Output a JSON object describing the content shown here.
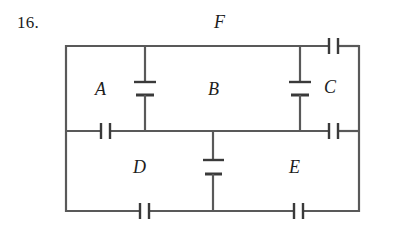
{
  "figure": {
    "problem_number": "16.",
    "type": "circuit-diagram",
    "line_color": "#595959",
    "text_color": "#1d1d1d",
    "background": "#ffffff"
  },
  "labels": {
    "top_outer": "F",
    "upper_left": "A",
    "upper_middle": "B",
    "upper_right": "C",
    "lower_left": "D",
    "lower_right": "E"
  },
  "circuit": {
    "frame": {
      "left": 66,
      "top": 46,
      "right": 359,
      "bottom": 211
    },
    "middle_wire_y": 131,
    "branches": [
      {
        "name": "left-branch",
        "x": 145,
        "from_y": 46,
        "to_y": 131,
        "element": "battery"
      },
      {
        "name": "right-branch",
        "x": 300,
        "from_y": 46,
        "to_y": 131,
        "element": "battery"
      },
      {
        "name": "center-branch",
        "x": 213,
        "from_y": 131,
        "to_y": 211,
        "element": "battery"
      }
    ],
    "capacitors": [
      {
        "name": "top-right-capacitor",
        "x": 329,
        "y": 46,
        "orientation": "horizontal"
      },
      {
        "name": "middle-left-capacitor",
        "x": 101,
        "y": 131,
        "orientation": "horizontal"
      },
      {
        "name": "middle-right-capacitor",
        "x": 329,
        "y": 131,
        "orientation": "horizontal"
      },
      {
        "name": "bottom-left-capacitor",
        "x": 140,
        "y": 211,
        "orientation": "horizontal"
      },
      {
        "name": "bottom-right-capacitor",
        "x": 294,
        "y": 211,
        "orientation": "horizontal"
      }
    ]
  }
}
